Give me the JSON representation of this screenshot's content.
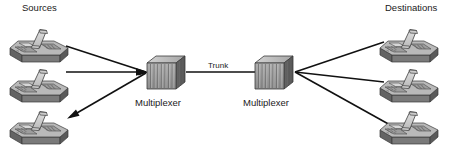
{
  "diagram": {
    "background_color": "#ffffff",
    "line_color": "#111111",
    "labels": {
      "sources": "Sources",
      "destinations": "Destinations",
      "trunk": "Trunk",
      "multiplexer_left": "Multiplexer",
      "multiplexer_right": "Multiplexer"
    },
    "nodes": {
      "source_phones": [
        {
          "name": "source-phone-1",
          "x": 8,
          "y": 22
        },
        {
          "name": "source-phone-2",
          "x": 8,
          "y": 62
        },
        {
          "name": "source-phone-3",
          "x": 8,
          "y": 104
        }
      ],
      "destination_phones": [
        {
          "name": "destination-phone-1",
          "x": 378,
          "y": 22
        },
        {
          "name": "destination-phone-2",
          "x": 378,
          "y": 62
        },
        {
          "name": "destination-phone-3",
          "x": 378,
          "y": 104
        }
      ],
      "multiplexers": [
        {
          "name": "multiplexer-left",
          "x": 148,
          "y": 54
        },
        {
          "name": "multiplexer-right",
          "x": 255,
          "y": 54
        }
      ]
    },
    "links": [
      {
        "name": "link-source-1",
        "from": "source-phone-1",
        "to": "multiplexer-left",
        "arrow": "to-multiplexer"
      },
      {
        "name": "link-source-2",
        "from": "source-phone-2",
        "to": "multiplexer-left",
        "arrow": "to-multiplexer"
      },
      {
        "name": "link-source-3",
        "from": "multiplexer-left",
        "to": "source-phone-3",
        "arrow": "to-phone"
      },
      {
        "name": "link-trunk",
        "from": "multiplexer-left",
        "to": "multiplexer-right",
        "arrow": "none"
      },
      {
        "name": "link-destination-1",
        "from": "multiplexer-right",
        "to": "destination-phone-1",
        "arrow": "none"
      },
      {
        "name": "link-destination-2",
        "from": "multiplexer-right",
        "to": "destination-phone-2",
        "arrow": "none"
      },
      {
        "name": "link-destination-3",
        "from": "multiplexer-right",
        "to": "destination-phone-3",
        "arrow": "none"
      }
    ],
    "colors": {
      "phone_top": "#b4b4b4",
      "phone_front": "#8e8e8e",
      "phone_side": "#6e6e6e",
      "phone_keypad": "#9a9a9a",
      "handset": "#d4d4d4",
      "mux_front": "#a0a0a0",
      "mux_top": "#c2c2c2",
      "mux_side": "#5e5e5e",
      "outline": "#3a3a3a"
    }
  }
}
